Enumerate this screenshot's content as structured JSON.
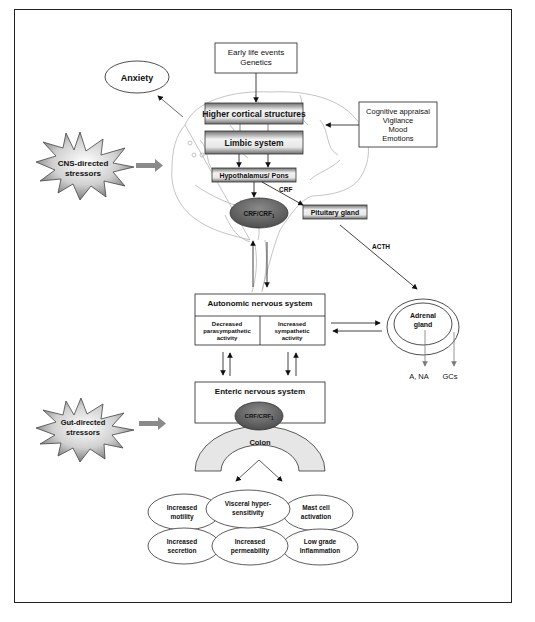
{
  "figure": {
    "inputs": {
      "early_life": [
        "Early life events",
        "Genetics"
      ],
      "cognitive": [
        "Cognitive appraisal",
        "Vigilance",
        "Mood",
        "Emotions"
      ]
    },
    "anxiety": "Anxiety",
    "stressors": {
      "cns": [
        "CNS-directed",
        "stressors"
      ],
      "gut": [
        "Gut-directed",
        "stressors"
      ]
    },
    "brain": {
      "higher_cortical": "Higher cortical structures",
      "limbic": "Limbic system",
      "hypothalamus": "Hypothalamus/ Pons",
      "crf_label": "CRF",
      "pituitary": "Pituitary gland",
      "crf_receptor": "CRF/CRF",
      "crf_receptor_sub": "1"
    },
    "acth": "ACTH",
    "ans": {
      "title": "Autonomic nervous system",
      "left": [
        "Decreased",
        "parasympathetic",
        "activity"
      ],
      "right": [
        "Increased",
        "sympathetic",
        "activity"
      ]
    },
    "adrenal": {
      "label": [
        "Adrenal",
        "gland"
      ],
      "outputs": [
        "A, NA",
        "GCs"
      ]
    },
    "ens": {
      "title": "Enteric nervous system",
      "crf_receptor": "CRF/CRF",
      "crf_receptor_sub": "1",
      "colon": "Colon"
    },
    "effects": [
      [
        "Increased",
        "motility"
      ],
      [
        "Visceral hyper-",
        "sensitivity"
      ],
      [
        "Mast cell",
        "activation"
      ],
      [
        "Increased",
        "secretion"
      ],
      [
        "Increased",
        "permeability"
      ],
      [
        "Low grade",
        "Inflammation"
      ]
    ],
    "colors": {
      "box_gradient_dark": "#6e6e6e",
      "box_gradient_light": "#f2f2f2",
      "oval_fill": "#5f5f5f",
      "colon_fill": "#e6e6e6",
      "arrow_gray": "#8a8a8a"
    }
  }
}
